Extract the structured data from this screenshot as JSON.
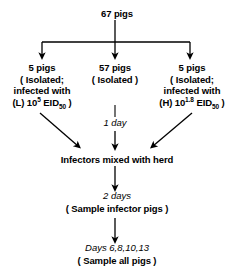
{
  "diagram": {
    "title_node": {
      "label": "67 pigs"
    },
    "branches": [
      {
        "id": "low-dose",
        "line1": "5 pigs",
        "line2": "( Isolated;",
        "line3": "infected with",
        "line4_prefix": "(L) 10",
        "line4_exponent": "5",
        "line4_unit": "EID",
        "line4_subscript": "50",
        "line4_suffix": " )"
      },
      {
        "id": "control",
        "line1": "57 pigs",
        "line2": "( Isolated )"
      },
      {
        "id": "high-dose",
        "line1": "5 pigs",
        "line2": "( Isolated;",
        "line3": "infected with",
        "line4_prefix": "(H) 10",
        "line4_exponent": "1.8",
        "line4_unit": "EID",
        "line4_subscript": "50",
        "line4_suffix": " )"
      }
    ],
    "timing_labels": {
      "one_day": "1 day",
      "two_days": "2 days",
      "sample_days": "Days 6,8,10,13"
    },
    "steps": {
      "mixing": "Infectors mixed with herd",
      "sample_infectors": "( Sample infector pigs )",
      "sample_all": "( Sample all pigs )"
    },
    "stroke_color": "#000000"
  }
}
